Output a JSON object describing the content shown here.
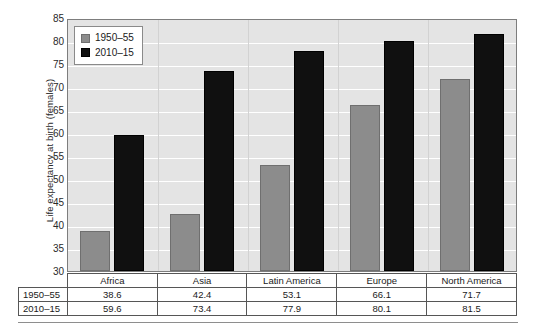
{
  "chart_data": {
    "type": "bar",
    "title": "",
    "xlabel": "",
    "ylabel": "Life expectancy at birth (females)",
    "categories": [
      "Africa",
      "Asia",
      "Latin America",
      "Europe",
      "North America"
    ],
    "series": [
      {
        "name": "1950–55",
        "color": "#8c8c8c",
        "values": [
          38.6,
          42.4,
          53.1,
          66.1,
          71.7
        ]
      },
      {
        "name": "2010–15",
        "color": "#101010",
        "values": [
          59.6,
          73.4,
          77.9,
          80.1,
          81.5
        ]
      }
    ],
    "ylim": [
      30,
      85
    ],
    "ytick_step": 5,
    "yticks": [
      85,
      80,
      75,
      70,
      65,
      60,
      55,
      50,
      45,
      40,
      35,
      30
    ],
    "ytick_labels": [
      "85",
      "80",
      "75",
      "70",
      "65",
      "60",
      "55",
      "50",
      "45",
      "40",
      "35",
      "30"
    ],
    "grid": true,
    "grid_color": "#ffffff",
    "plot_background": "#e4e4e4",
    "legend_position": "top-left"
  },
  "legend": {
    "entries": [
      {
        "label": "1950–55",
        "swatch": "gray-square-swatch"
      },
      {
        "label": "2010–15",
        "swatch": "black-square-swatch"
      }
    ]
  },
  "table": {
    "corner_label": "",
    "column_headers": [
      "Africa",
      "Asia",
      "Latin America",
      "Europe",
      "North America"
    ],
    "rows": [
      {
        "label": "1950–55",
        "cells": [
          "38.6",
          "42.4",
          "53.1",
          "66.1",
          "71.7"
        ]
      },
      {
        "label": "2010–15",
        "cells": [
          "59.6",
          "73.4",
          "77.9",
          "80.1",
          "81.5"
        ]
      }
    ]
  }
}
